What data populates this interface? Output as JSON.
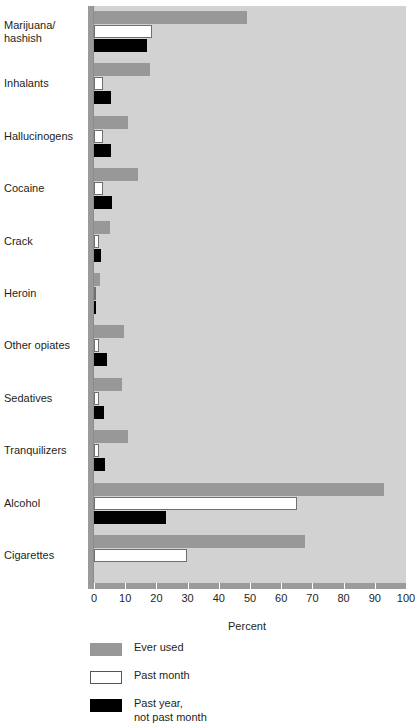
{
  "chart_data": {
    "type": "bar",
    "orientation": "horizontal",
    "title": "",
    "xlabel": "Percent",
    "ylabel": "",
    "xlim": [
      0,
      100
    ],
    "xticks": [
      0,
      10,
      20,
      30,
      40,
      50,
      60,
      70,
      80,
      90,
      100
    ],
    "grid": false,
    "legend_position": "below-axis-left",
    "categories": [
      "Marijuana/\nhashish",
      "Inhalants",
      "Hallucinogens",
      "Cocaine",
      "Crack",
      "Heroin",
      "Other opiates",
      "Sedatives",
      "Tranquilizers",
      "Alcohol",
      "Cigarettes"
    ],
    "series": [
      {
        "name": "Ever used",
        "color": "#989898",
        "values": [
          49,
          18,
          11,
          14,
          5.2,
          2,
          9.7,
          9,
          11,
          93,
          67.5
        ]
      },
      {
        "name": "Past month",
        "color": "#ffffff",
        "values": [
          18.7,
          3,
          3,
          3,
          1.6,
          0.7,
          1.6,
          1.6,
          1.6,
          65,
          29.7
        ]
      },
      {
        "name": "Past year,\nnot past month",
        "color": "#000000",
        "values": [
          17,
          5.5,
          5.5,
          5.8,
          2.3,
          0.7,
          4.2,
          3.2,
          3.5,
          23,
          0
        ]
      }
    ]
  },
  "axis": {
    "x_title": "Percent",
    "tick_labels": [
      "0",
      "10",
      "20",
      "30",
      "40",
      "50",
      "60",
      "70",
      "80",
      "90",
      "100"
    ]
  },
  "legend": {
    "items": [
      {
        "label": "Ever used",
        "swatch": "gray-swatch"
      },
      {
        "label": "Past month",
        "swatch": "white-swatch"
      },
      {
        "label": "Past year,\nnot past month",
        "swatch": "black-swatch"
      }
    ]
  },
  "colors": {
    "plot_background": "#d2d2d2",
    "axis": "#9a9a9a",
    "ever_used": "#989898",
    "past_month": "#ffffff",
    "past_year": "#000000",
    "text": "#231f20"
  }
}
